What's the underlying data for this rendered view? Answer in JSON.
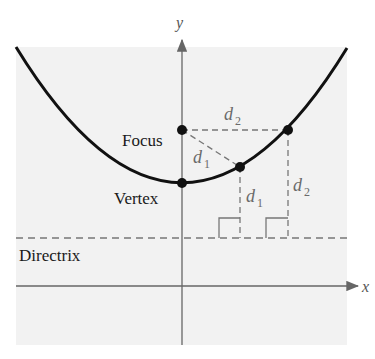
{
  "diagram": {
    "axes": {
      "x_label": "x",
      "y_label": "y"
    },
    "labels": {
      "focus": "Focus",
      "vertex": "Vertex",
      "directrix": "Directrix"
    },
    "distances": [
      {
        "name": "d",
        "subscript": "1",
        "position": "focus-to-point1"
      },
      {
        "name": "d",
        "subscript": "1",
        "position": "point1-to-directrix"
      },
      {
        "name": "d",
        "subscript": "2",
        "position": "focus-to-point2"
      },
      {
        "name": "d",
        "subscript": "2",
        "position": "point2-to-directrix"
      }
    ],
    "colors": {
      "background_panel": "#f2f2f2",
      "curve": "#111111",
      "axes": "#666666",
      "dashed": "#777777",
      "points": "#111111"
    }
  }
}
